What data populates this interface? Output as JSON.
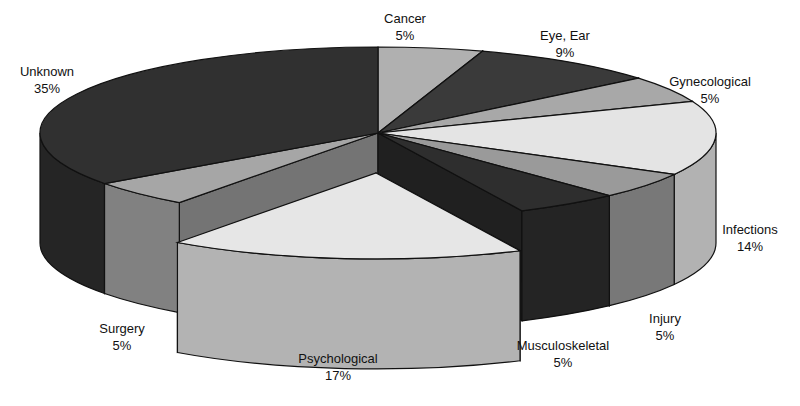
{
  "chart_data": {
    "type": "pie",
    "style": "3d-exploded",
    "title": "",
    "categories": [
      "Cancer",
      "Eye, Ear",
      "Gynecological",
      "Infections",
      "Injury",
      "Musculoskeletal",
      "Psychological",
      "Surgery",
      "Unknown"
    ],
    "values": [
      5,
      9,
      5,
      14,
      5,
      5,
      17,
      5,
      35
    ],
    "unit": "%",
    "exploded": [
      "Psychological"
    ],
    "labels": [
      {
        "name": "Cancer",
        "pct": "5%"
      },
      {
        "name": "Eye, Ear",
        "pct": "9%"
      },
      {
        "name": "Gynecological",
        "pct": "5%"
      },
      {
        "name": "Infections",
        "pct": "14%"
      },
      {
        "name": "Injury",
        "pct": "5%"
      },
      {
        "name": "Musculoskeletal",
        "pct": "5%"
      },
      {
        "name": "Psychological",
        "pct": "17%"
      },
      {
        "name": "Surgery",
        "pct": "5%"
      },
      {
        "name": "Unknown",
        "pct": "35%"
      }
    ],
    "legend": "none (labels placed around pie)"
  },
  "colors": {
    "Cancer": "#b0b0b0",
    "Eye, Ear": "#3a3a3a",
    "Gynecological": "#a8a8a8",
    "Infections": "#e4e4e4",
    "Injury": "#9a9a9a",
    "Musculoskeletal": "#2e2e2e",
    "Psychological": "#e6e6e6",
    "Surgery": "#a6a6a6",
    "Unknown": "#303030"
  }
}
